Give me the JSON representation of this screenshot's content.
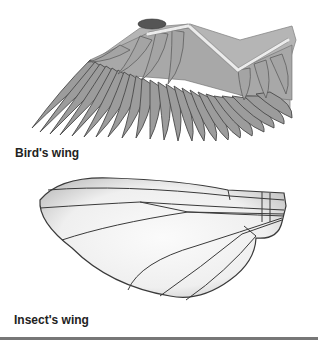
{
  "figure": {
    "panels": [
      {
        "id": "bird",
        "label": "Bird's wing"
      },
      {
        "id": "insect",
        "label": "Insect's wing"
      }
    ]
  },
  "colors": {
    "feather_fill": "#9a9a9a",
    "feather_edge": "#4a4a4a",
    "skin_fill": "#b8b8b8",
    "bone": "#e6e6e6",
    "insect_membrane": "#f2f2f2",
    "insect_vein": "#3a3a3a",
    "rule": "#777777"
  }
}
